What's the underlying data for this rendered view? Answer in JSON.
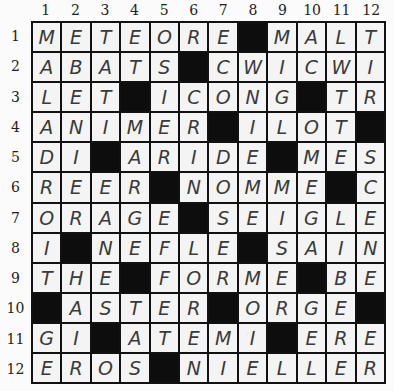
{
  "puzzle": {
    "type": "crossword",
    "size": 12,
    "column_labels": [
      "1",
      "2",
      "3",
      "4",
      "5",
      "6",
      "7",
      "8",
      "9",
      "10",
      "11",
      "12"
    ],
    "row_labels": [
      "1",
      "2",
      "3",
      "4",
      "5",
      "6",
      "7",
      "8",
      "9",
      "10",
      "11",
      "12"
    ],
    "black_color": "#0d0d0d",
    "grid": [
      [
        "M",
        "E",
        "T",
        "E",
        "O",
        "R",
        "E",
        "#",
        "M",
        "A",
        "L",
        "T"
      ],
      [
        "A",
        "B",
        "A",
        "T",
        "S",
        "#",
        "C",
        "W",
        "I",
        "C",
        "W",
        "I"
      ],
      [
        "L",
        "E",
        "T",
        "#",
        "I",
        "C",
        "O",
        "N",
        "G",
        "#",
        "T",
        "R"
      ],
      [
        "A",
        "N",
        "I",
        "M",
        "E",
        "R",
        "#",
        "I",
        "L",
        "O",
        "T",
        "#"
      ],
      [
        "D",
        "I",
        "#",
        "A",
        "R",
        "I",
        "D",
        "E",
        "#",
        "M",
        "E",
        "S"
      ],
      [
        "R",
        "E",
        "E",
        "R",
        "#",
        "N",
        "O",
        "M",
        "M",
        "E",
        "#",
        "C"
      ],
      [
        "O",
        "R",
        "A",
        "G",
        "E",
        "#",
        "S",
        "E",
        "I",
        "G",
        "L",
        "E"
      ],
      [
        "I",
        "#",
        "N",
        "E",
        "F",
        "L",
        "E",
        "#",
        "S",
        "A",
        "I",
        "N"
      ],
      [
        "T",
        "H",
        "E",
        "#",
        "F",
        "O",
        "R",
        "M",
        "E",
        "#",
        "B",
        "E"
      ],
      [
        "#",
        "A",
        "S",
        "T",
        "E",
        "R",
        "#",
        "O",
        "R",
        "G",
        "E",
        "#"
      ],
      [
        "G",
        "I",
        "#",
        "A",
        "T",
        "E",
        "M",
        "I",
        "#",
        "E",
        "R",
        "E"
      ],
      [
        "E",
        "R",
        "O",
        "S",
        "#",
        "N",
        "I",
        "E",
        "L",
        "L",
        "E",
        "R"
      ]
    ]
  }
}
